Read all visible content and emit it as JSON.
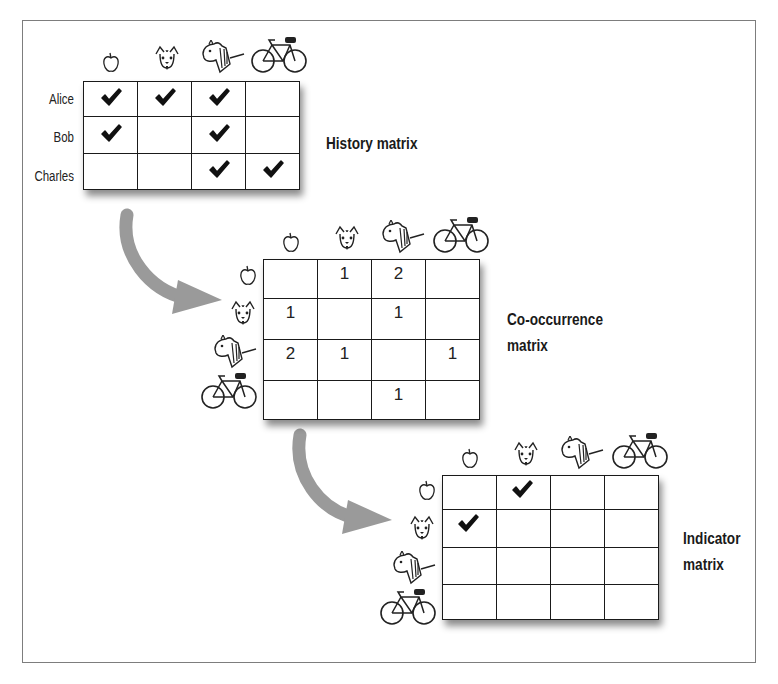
{
  "items": [
    {
      "name": "apple",
      "icon": "apple-icon"
    },
    {
      "name": "puppy",
      "icon": "puppy-icon"
    },
    {
      "name": "pony",
      "icon": "pony-icon"
    },
    {
      "name": "bicycle",
      "icon": "bicycle-icon"
    }
  ],
  "history": {
    "title": "History matrix",
    "users": [
      "Alice",
      "Bob",
      "Charles"
    ],
    "rows": [
      [
        true,
        true,
        true,
        false
      ],
      [
        true,
        false,
        true,
        false
      ],
      [
        false,
        false,
        true,
        true
      ]
    ]
  },
  "cooccurrence": {
    "title_line1": "Co-occurrence",
    "title_line2": "matrix",
    "rows": [
      [
        "",
        "1",
        "2",
        ""
      ],
      [
        "1",
        "",
        "1",
        ""
      ],
      [
        "2",
        "1",
        "",
        "1"
      ],
      [
        "",
        "",
        "1",
        ""
      ]
    ]
  },
  "indicator": {
    "title_line1": "Indicator",
    "title_line2": "matrix",
    "rows": [
      [
        false,
        true,
        false,
        false
      ],
      [
        true,
        false,
        false,
        false
      ],
      [
        false,
        false,
        false,
        false
      ],
      [
        false,
        false,
        false,
        false
      ]
    ]
  },
  "colors": {
    "arrow": "#9a9a9a",
    "grid_line": "#1a1a1a",
    "check": "#111111",
    "frame": "#7d7d7d"
  }
}
